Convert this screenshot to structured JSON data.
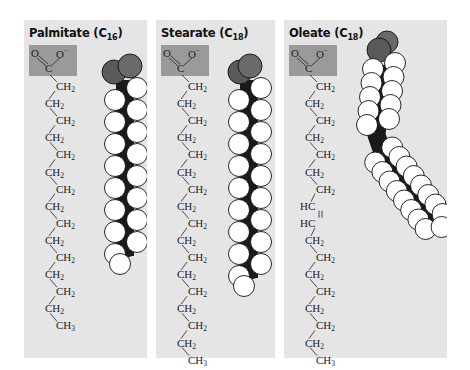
{
  "figure": {
    "panels": [
      {
        "id": "palmitate",
        "name": "Palmitate",
        "carbon_label": "C",
        "carbon_count": "16",
        "head_group": {
          "o_left": "O",
          "o_right": "O",
          "charge": "−",
          "carbon": "C"
        },
        "chain": [
          "CH2",
          "CH2",
          "CH2",
          "CH2",
          "CH2",
          "CH2",
          "CH2",
          "CH2",
          "CH2",
          "CH2",
          "CH2",
          "CH2",
          "CH2",
          "CH2",
          "CH3"
        ],
        "double_bond": false,
        "model_shape": "straight"
      },
      {
        "id": "stearate",
        "name": "Stearate",
        "carbon_label": "C",
        "carbon_count": "18",
        "head_group": {
          "o_left": "O",
          "o_right": "O",
          "charge": "−",
          "carbon": "C"
        },
        "chain": [
          "CH2",
          "CH2",
          "CH2",
          "CH2",
          "CH2",
          "CH2",
          "CH2",
          "CH2",
          "CH2",
          "CH2",
          "CH2",
          "CH2",
          "CH2",
          "CH2",
          "CH2",
          "CH2",
          "CH3"
        ],
        "double_bond": false,
        "model_shape": "straight"
      },
      {
        "id": "oleate",
        "name": "Oleate",
        "carbon_label": "C",
        "carbon_count": "18",
        "head_group": {
          "o_left": "O",
          "o_right": "O",
          "charge": "−",
          "carbon": "C"
        },
        "chain": [
          "CH2",
          "CH2",
          "CH2",
          "CH2",
          "CH2",
          "CH2",
          "CH2",
          "HC",
          "HC",
          "CH2",
          "CH2",
          "CH2",
          "CH2",
          "CH2",
          "CH2",
          "CH2",
          "CH3"
        ],
        "double_bond": true,
        "double_bond_between": [
          "HC",
          "HC"
        ],
        "model_shape": "kinked"
      }
    ],
    "colors": {
      "panel_bg": "#e5e5e5",
      "carboxyl_box": "#9a9a9a",
      "oxygen_atom": "#5a5a5a",
      "carbon_atom": "#1a1a1a",
      "hydrogen_atom": "#ffffff",
      "text": "#222222"
    }
  }
}
